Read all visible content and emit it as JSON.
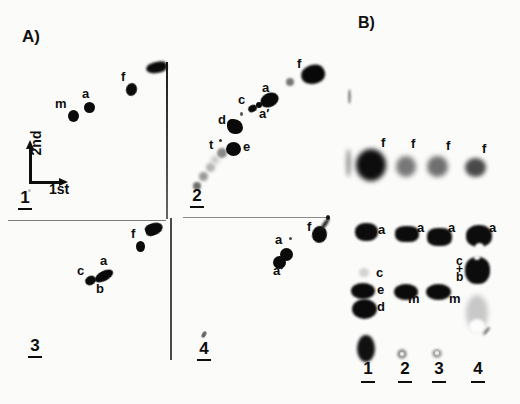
{
  "figure": {
    "panel_a": {
      "title": "A)",
      "axis": {
        "second": "2nd",
        "first": "1st"
      },
      "quadrants": [
        {
          "t": "1",
          "x": 18,
          "y": 189,
          "n": "quadrant-label-1"
        },
        {
          "t": "2",
          "x": 190,
          "y": 187,
          "n": "quadrant-label-2"
        },
        {
          "t": "3",
          "x": 28,
          "y": 337,
          "n": "quadrant-label-3"
        },
        {
          "t": "4",
          "x": 197,
          "y": 340,
          "n": "quadrant-label-4"
        }
      ],
      "labels": [
        {
          "t": "m",
          "x": 55,
          "y": 97,
          "n": "q1-spot-label-m"
        },
        {
          "t": "a",
          "x": 82,
          "y": 87,
          "n": "q1-spot-label-a"
        },
        {
          "t": "f",
          "x": 121,
          "y": 70,
          "n": "q1-spot-label-f"
        },
        {
          "t": "t",
          "x": 209,
          "y": 138,
          "n": "q2-spot-label-t"
        },
        {
          "t": "e",
          "x": 243,
          "y": 140,
          "n": "q2-spot-label-e"
        },
        {
          "t": "d",
          "x": 218,
          "y": 113,
          "n": "q2-spot-label-d"
        },
        {
          "t": "c",
          "x": 238,
          "y": 93,
          "n": "q2-spot-label-c"
        },
        {
          "t": "a",
          "x": 262,
          "y": 81,
          "n": "q2-spot-label-a"
        },
        {
          "t": "a′",
          "x": 259,
          "y": 107,
          "n": "q2-spot-label-a-prime"
        },
        {
          "t": "f",
          "x": 297,
          "y": 57,
          "n": "q2-spot-label-f"
        },
        {
          "t": "f",
          "x": 131,
          "y": 227,
          "n": "q3-spot-label-f"
        },
        {
          "t": "a",
          "x": 100,
          "y": 254,
          "n": "q3-spot-label-a"
        },
        {
          "t": "c",
          "x": 77,
          "y": 264,
          "n": "q3-spot-label-c"
        },
        {
          "t": "b",
          "x": 96,
          "y": 282,
          "n": "q3-spot-label-b"
        },
        {
          "t": "f",
          "x": 307,
          "y": 220,
          "n": "q4-spot-label-f"
        },
        {
          "t": "a",
          "x": 275,
          "y": 233,
          "n": "q4-spot-label-a"
        },
        {
          "t": "a′",
          "x": 273,
          "y": 264,
          "n": "q4-spot-label-a-prime"
        }
      ],
      "spots": [
        {
          "x": 73,
          "y": 116,
          "w": 11,
          "h": 12,
          "c": "#0b0b0b",
          "b": 0.6,
          "n": "q1-spot-m"
        },
        {
          "x": 89,
          "y": 107,
          "w": 11,
          "h": 11,
          "c": "#0b0b0b",
          "b": 0.6,
          "n": "q1-spot-a"
        },
        {
          "x": 131,
          "y": 89,
          "w": 11,
          "h": 13,
          "c": "#0b0b0b",
          "b": 0.6,
          "r": 15,
          "n": "q1-spot-f"
        },
        {
          "x": 156,
          "y": 67,
          "w": 21,
          "h": 11,
          "c": "#0a0a0a",
          "b": 0.8,
          "r": -10,
          "br": "60% 40% 50% 60%",
          "n": "q1-corner-blob"
        },
        {
          "x": 197,
          "y": 186,
          "w": 8,
          "h": 8,
          "c": "#6e6e6e",
          "b": 1.2,
          "n": "q2-arc-spot"
        },
        {
          "x": 203,
          "y": 176,
          "w": 9,
          "h": 9,
          "c": "#999999",
          "b": 1.5,
          "n": "q2-arc-spot"
        },
        {
          "x": 210,
          "y": 167,
          "w": 9,
          "h": 9,
          "c": "#b5b5b5",
          "b": 1.8,
          "n": "q2-arc-spot"
        },
        {
          "x": 215,
          "y": 160,
          "w": 8,
          "h": 8,
          "c": "#c5c5c5",
          "b": 2,
          "n": "q2-arc-spot"
        },
        {
          "x": 222,
          "y": 153,
          "w": 10,
          "h": 10,
          "c": "#8a8a8a",
          "b": 1.3,
          "n": "q2-spot-t"
        },
        {
          "x": 233,
          "y": 149,
          "w": 15,
          "h": 14,
          "c": "#0a0a0a",
          "b": 0.7,
          "n": "q2-spot-e"
        },
        {
          "x": 235,
          "y": 126,
          "w": 16,
          "h": 15,
          "c": "#0a0a0a",
          "b": 0.7,
          "br": "35% 65% 45% 55%",
          "n": "q2-spot-d"
        },
        {
          "x": 241,
          "y": 114,
          "w": 3,
          "h": 4,
          "c": "#555555",
          "b": 0.4,
          "n": "q2-speck"
        },
        {
          "x": 220,
          "y": 140,
          "w": 3,
          "h": 3,
          "c": "#333333",
          "b": 0.3,
          "n": "q2-t-asterisk"
        },
        {
          "x": 252,
          "y": 108,
          "w": 9,
          "h": 7,
          "c": "#0a0a0a",
          "b": 0.6,
          "r": -25,
          "n": "q2-spot-c"
        },
        {
          "x": 259,
          "y": 105,
          "w": 6,
          "h": 6,
          "c": "#0a0a0a",
          "b": 0.6,
          "n": "q2-spot-a-prime"
        },
        {
          "x": 269,
          "y": 100,
          "w": 19,
          "h": 14,
          "c": "#080808",
          "b": 0.7,
          "r": -25,
          "n": "q2-spot-a"
        },
        {
          "x": 290,
          "y": 82,
          "w": 8,
          "h": 8,
          "c": "#777777",
          "b": 1.2,
          "n": "q2-spot-f-satellite"
        },
        {
          "x": 313,
          "y": 74,
          "w": 24,
          "h": 19,
          "c": "#080808",
          "b": 0.8,
          "r": -20,
          "br": "50% 50% 45% 60%",
          "n": "q2-spot-f"
        },
        {
          "x": 154,
          "y": 229,
          "w": 18,
          "h": 12,
          "c": "#0a0a0a",
          "b": 0.7,
          "r": -20,
          "br": "40% 60% 60% 40%",
          "n": "q3-corner-blob"
        },
        {
          "x": 140,
          "y": 246,
          "w": 9,
          "h": 11,
          "c": "#0a0a0a",
          "b": 0.6,
          "n": "q3-spot-f"
        },
        {
          "x": 90,
          "y": 280,
          "w": 11,
          "h": 9,
          "c": "#0a0a0a",
          "b": 0.6,
          "r": -30,
          "n": "q3-spot-c"
        },
        {
          "x": 104,
          "y": 276,
          "w": 20,
          "h": 10,
          "c": "#080808",
          "b": 0.6,
          "r": -28,
          "n": "q3-spot-ab"
        },
        {
          "x": 319,
          "y": 234,
          "w": 15,
          "h": 17,
          "c": "#0a0a0a",
          "b": 0.7,
          "r": 10,
          "n": "q4-spot-f"
        },
        {
          "x": 325,
          "y": 224,
          "w": 4,
          "h": 14,
          "c": "#222222",
          "b": 0.8,
          "r": 35,
          "n": "q4-spot-f-tail"
        },
        {
          "x": 328,
          "y": 217,
          "w": 4,
          "h": 5,
          "c": "#111111",
          "b": 0.4,
          "n": "q4-corner-tick"
        },
        {
          "x": 286,
          "y": 254,
          "w": 13,
          "h": 13,
          "c": "#0a0a0a",
          "b": 0.6,
          "n": "q4-spot-a"
        },
        {
          "x": 279,
          "y": 262,
          "w": 13,
          "h": 13,
          "c": "#0a0a0a",
          "b": 0.6,
          "n": "q4-spot-a-prime"
        },
        {
          "x": 290,
          "y": 238,
          "w": 3,
          "h": 3,
          "c": "#444444",
          "b": 0.3,
          "n": "q4-speck"
        },
        {
          "x": 204,
          "y": 334,
          "w": 4,
          "h": 7,
          "c": "#666666",
          "b": 0.5,
          "r": 30,
          "n": "q4-speck-above-label"
        },
        {
          "x": 29,
          "y": 190,
          "w": 3,
          "h": 3,
          "c": "#bbbbbb",
          "b": 0.4,
          "n": "q1-origin-speck"
        }
      ]
    },
    "panel_b": {
      "title": "B)",
      "lanes": [
        {
          "t": "1",
          "x": 361,
          "y": 360,
          "n": "lane-label-1"
        },
        {
          "t": "2",
          "x": 398,
          "y": 360,
          "n": "lane-label-2"
        },
        {
          "t": "3",
          "x": 432,
          "y": 360,
          "n": "lane-label-3"
        },
        {
          "t": "4",
          "x": 471,
          "y": 360,
          "n": "lane-label-4"
        }
      ],
      "labels": [
        {
          "t": "f",
          "x": 381,
          "y": 136,
          "n": "b-lane1-label-f"
        },
        {
          "t": "f",
          "x": 411,
          "y": 137,
          "n": "b-lane2-label-f"
        },
        {
          "t": "f",
          "x": 446,
          "y": 139,
          "n": "b-lane3-label-f"
        },
        {
          "t": "f",
          "x": 482,
          "y": 142,
          "n": "b-lane4-label-f"
        },
        {
          "t": "a",
          "x": 378,
          "y": 223,
          "n": "b-lane1-label-a"
        },
        {
          "t": "a",
          "x": 417,
          "y": 221,
          "n": "b-lane2-label-a"
        },
        {
          "t": "a",
          "x": 448,
          "y": 221,
          "n": "b-lane3-label-a"
        },
        {
          "t": "a",
          "x": 489,
          "y": 221,
          "n": "b-lane4-label-a"
        },
        {
          "t": "c",
          "x": 456,
          "y": 255,
          "fs": 12,
          "n": "b-lane4-label-c"
        },
        {
          "t": "+",
          "x": 456,
          "y": 263,
          "fs": 12,
          "n": "b-lane4-label-plus"
        },
        {
          "t": "b",
          "x": 456,
          "y": 271,
          "fs": 12,
          "n": "b-lane4-label-b"
        },
        {
          "t": "c",
          "x": 376,
          "y": 266,
          "n": "b-lane1-label-c"
        },
        {
          "t": "e",
          "x": 377,
          "y": 283,
          "n": "b-lane1-label-e"
        },
        {
          "t": "d",
          "x": 377,
          "y": 300,
          "n": "b-lane1-label-d"
        },
        {
          "t": "m",
          "x": 408,
          "y": 292,
          "n": "b-lane2-label-m"
        },
        {
          "t": "m",
          "x": 449,
          "y": 292,
          "n": "b-lane3-label-m"
        }
      ],
      "spots": [
        {
          "x": 349,
          "y": 96,
          "w": 3,
          "h": 15,
          "c": "#8a8a8a",
          "b": 1,
          "n": "b-edge-dash"
        },
        {
          "x": 348,
          "y": 163,
          "w": 5,
          "h": 28,
          "c": "#9a9a9a",
          "b": 2,
          "n": "b-edge-smear"
        },
        {
          "x": 371,
          "y": 165,
          "w": 30,
          "h": 32,
          "c": "#0d0d0d",
          "b": 2.5,
          "n": "b-lane1-band-f"
        },
        {
          "x": 406,
          "y": 166,
          "w": 20,
          "h": 21,
          "c": "#787878",
          "b": 2.5,
          "n": "b-lane2-band-f"
        },
        {
          "x": 437,
          "y": 166,
          "w": 21,
          "h": 21,
          "c": "#6f6f6f",
          "b": 2.5,
          "n": "b-lane3-band-f"
        },
        {
          "x": 475,
          "y": 167,
          "w": 21,
          "h": 19,
          "c": "#4a4a4a",
          "b": 2.2,
          "n": "b-lane4-band-f"
        },
        {
          "x": 366,
          "y": 232,
          "w": 23,
          "h": 18,
          "c": "#0c0c0c",
          "b": 1.2,
          "br": "45%",
          "n": "b-lane1-band-a"
        },
        {
          "x": 407,
          "y": 234,
          "w": 24,
          "h": 16,
          "c": "#0c0c0c",
          "b": 1.2,
          "br": "40%",
          "n": "b-lane2-band-a"
        },
        {
          "x": 439,
          "y": 237,
          "w": 25,
          "h": 18,
          "c": "#0c0c0c",
          "b": 1.2,
          "br": "40%",
          "n": "b-lane3-band-a"
        },
        {
          "x": 479,
          "y": 236,
          "w": 26,
          "h": 22,
          "c": "#0c0c0c",
          "b": 1.2,
          "br": "45%",
          "n": "b-lane4-band-a"
        },
        {
          "x": 479,
          "y": 247,
          "w": 9,
          "h": 9,
          "c": "#fbfbfa",
          "b": 1,
          "n": "b-lane4-band-a-notch"
        },
        {
          "x": 477,
          "y": 270,
          "w": 25,
          "h": 27,
          "c": "#0c0c0c",
          "b": 1.2,
          "br": "45%",
          "n": "b-lane4-band-cb"
        },
        {
          "x": 477,
          "y": 257,
          "w": 6,
          "h": 5,
          "c": "#fbfbfa",
          "b": 1,
          "n": "b-lane4-band-cb-notch"
        },
        {
          "x": 364,
          "y": 272,
          "w": 10,
          "h": 9,
          "c": "#d2d2d2",
          "b": 1.5,
          "n": "b-lane1-band-c-faint"
        },
        {
          "x": 363,
          "y": 291,
          "w": 24,
          "h": 16,
          "c": "#0b0b0b",
          "b": 1.3,
          "n": "b-lane1-band-e"
        },
        {
          "x": 364,
          "y": 309,
          "w": 25,
          "h": 20,
          "c": "#0b0b0b",
          "b": 1.3,
          "n": "b-lane1-band-d"
        },
        {
          "x": 406,
          "y": 292,
          "w": 24,
          "h": 16,
          "c": "#0b0b0b",
          "b": 1.2,
          "n": "b-lane2-band-m"
        },
        {
          "x": 438,
          "y": 292,
          "w": 25,
          "h": 16,
          "c": "#0b0b0b",
          "b": 1.2,
          "n": "b-lane3-band-m"
        },
        {
          "x": 477,
          "y": 313,
          "w": 22,
          "h": 36,
          "c": "#c8c8c8",
          "b": 2.5,
          "n": "b-lane4-smear"
        },
        {
          "x": 477,
          "y": 326,
          "w": 16,
          "h": 14,
          "c": "#fdfdfd",
          "b": 1.5,
          "n": "b-lane4-smear-highlight"
        },
        {
          "x": 486,
          "y": 331,
          "w": 3,
          "h": 10,
          "c": "#777777",
          "b": 0.8,
          "r": 40,
          "n": "b-lane4-dash"
        },
        {
          "x": 366,
          "y": 348,
          "w": 18,
          "h": 27,
          "c": "#111111",
          "b": 1.8,
          "n": "b-lane1-origin-spot"
        },
        {
          "x": 402,
          "y": 354,
          "w": 10,
          "h": 10,
          "c": "#9a9a9a",
          "b": 1.2,
          "n": "b-lane2-origin-dot"
        },
        {
          "x": 402,
          "y": 354,
          "w": 4,
          "h": 4,
          "c": "#e8e8e8",
          "b": 0.6,
          "n": "b-lane2-origin-dot-center"
        },
        {
          "x": 437,
          "y": 353,
          "w": 10,
          "h": 9,
          "c": "#a5a5a5",
          "b": 1.2,
          "n": "b-lane3-origin-dot"
        },
        {
          "x": 437,
          "y": 353,
          "w": 4,
          "h": 4,
          "c": "#eeeeee",
          "b": 0.6,
          "n": "b-lane3-origin-dot-center"
        }
      ]
    }
  }
}
